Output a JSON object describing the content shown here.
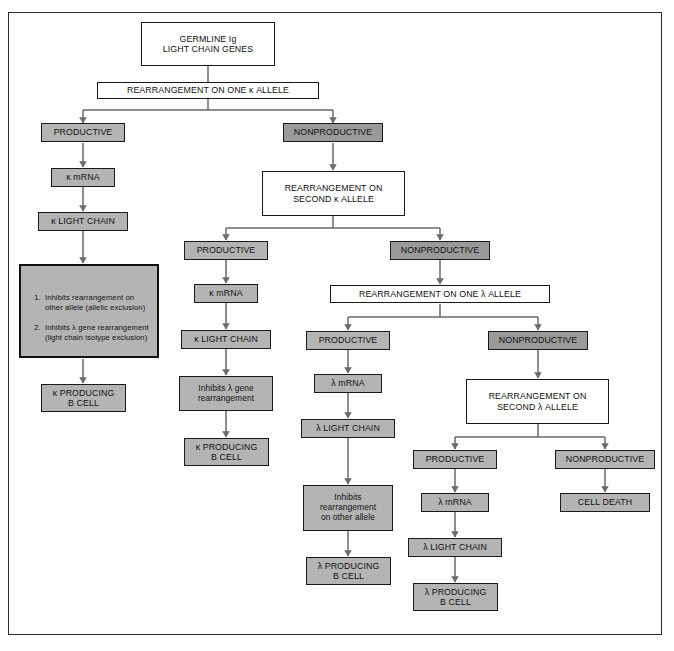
{
  "diagram": {
    "colors": {
      "node_fill_gray": "#b4b4b4",
      "node_fill_white": "#ffffff",
      "node_border": "#1a1a1a",
      "connector": "#555555",
      "frame_border": "#2b2b2b",
      "page_background": "#ffffff"
    }
  },
  "nodes": {
    "germline": "GERMLINE Ig\nLIGHT CHAIN GENES",
    "rearrange_one_kappa": "REARRANGEMENT ON ONE κ ALLELE",
    "k1_productive": "PRODUCTIVE",
    "k1_nonproductive": "NONPRODUCTIVE",
    "k1_mrna": "κ mRNA",
    "k1_light_chain": "κ LIGHT CHAIN",
    "k1_inhibits_list": {
      "item1": "Inhibits rearrangement on other allele (allelic exclusion)",
      "item2": "Inhibits λ  gene rearrangement (light chain isotype exclusion)"
    },
    "k1_b_cell": "κ PRODUCING\nB CELL",
    "rearrange_second_kappa": "REARRANGEMENT ON\nSECOND κ  ALLELE",
    "k2_productive": "PRODUCTIVE",
    "k2_nonproductive": "NONPRODUCTIVE",
    "k2_mrna": "κ mRNA",
    "k2_light_chain": "κ LIGHT CHAIN",
    "k2_inhibits": "Inhibits λ gene\nrearrangement",
    "k2_b_cell": "κ PRODUCING\nB CELL",
    "rearrange_one_lambda": "REARRANGEMENT ON ONE  λ  ALLELE",
    "l1_productive": "PRODUCTIVE",
    "l1_nonproductive": "NONPRODUCTIVE",
    "l1_mrna": "λ mRNA",
    "l1_light_chain": "λ  LIGHT CHAIN",
    "l1_inhibits": "Inhibits\nrearrangement\non other allele",
    "l1_b_cell": "λ PRODUCING\nB CELL",
    "rearrange_second_lambda": "REARRANGEMENT ON\nSECOND λ  ALLELE",
    "l2_productive": "PRODUCTIVE",
    "l2_nonproductive": "NONPRODUCTIVE",
    "l2_mrna": "λ mRNA",
    "l2_light_chain": "λ LIGHT CHAIN",
    "l2_b_cell": "λ PRODUCING\nB CELL",
    "cell_death": "CELL DEATH"
  }
}
